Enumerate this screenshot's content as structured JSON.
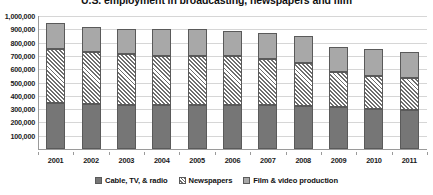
{
  "chart_data": {
    "type": "bar",
    "subtype": "stacked-column",
    "title": "U.S. employment in broadcasting, newspapers and film",
    "xlabel": "",
    "ylabel": "",
    "categories": [
      "2001",
      "2002",
      "2003",
      "2004",
      "2005",
      "2006",
      "2007",
      "2008",
      "2009",
      "2010",
      "2011"
    ],
    "series": [
      {
        "name": "Cable, TV, & radio",
        "color": "#767676",
        "fill": "solid",
        "values": [
          345000,
          338000,
          332000,
          333000,
          333000,
          331000,
          330000,
          327000,
          317000,
          303000,
          296000
        ]
      },
      {
        "name": "Newspapers",
        "color": "#6e6e6e",
        "fill": "diagonal-hatch",
        "values": [
          405000,
          390000,
          381000,
          370000,
          366000,
          366000,
          348000,
          323000,
          265000,
          245000,
          238000
        ]
      },
      {
        "name": "Film & video production",
        "color": "#a8a8a8",
        "fill": "solid",
        "values": [
          195000,
          192000,
          187000,
          202000,
          202000,
          190000,
          198000,
          200000,
          188000,
          205000,
          196000
        ]
      }
    ],
    "totals": [
      945000,
      920000,
      900000,
      905000,
      901000,
      887000,
      876000,
      850000,
      770000,
      753000,
      730000
    ],
    "ylim": [
      0,
      1000000
    ],
    "ytick_values": [
      100000,
      200000,
      300000,
      400000,
      500000,
      600000,
      700000,
      800000,
      900000,
      1000000
    ],
    "ytick_labels": [
      "100,000",
      "200,000",
      "300,000",
      "400,000",
      "500,000",
      "600,000",
      "700,000",
      "800,000",
      "900,000",
      "1,000,000"
    ],
    "grid": true,
    "legend_position": "bottom",
    "legend": [
      "Cable, TV, & radio",
      "Newspapers",
      "Film & video production"
    ]
  },
  "colors": {
    "cable": "#767676",
    "newspapers": "#6e6e6e",
    "film": "#a8a8a8",
    "gridline": "#d6d6d6",
    "axis": "#9a9a9a",
    "background": "#ffffff",
    "text": "#1a1a1a"
  }
}
